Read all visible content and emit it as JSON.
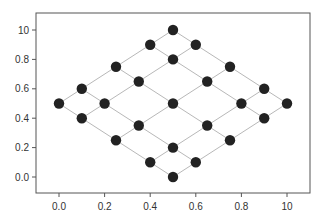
{
  "chart_data": {
    "type": "scatter",
    "title": "",
    "xlabel": "",
    "ylabel": "",
    "xlim": [
      -0.1,
      1.1
    ],
    "ylim": [
      -0.1,
      1.1
    ],
    "grid": false,
    "legend": null,
    "x_ticks": [
      {
        "value": 0.0,
        "label": "0.0"
      },
      {
        "value": 0.2,
        "label": "0.2"
      },
      {
        "value": 0.4,
        "label": "0.4"
      },
      {
        "value": 0.6,
        "label": "0.6"
      },
      {
        "value": 0.8,
        "label": "0.8"
      },
      {
        "value": 1.0,
        "label": "10"
      }
    ],
    "y_ticks": [
      {
        "value": 0.0,
        "label": "0.0"
      },
      {
        "value": 0.2,
        "label": "0.2"
      },
      {
        "value": 0.4,
        "label": "0.4"
      },
      {
        "value": 0.6,
        "label": "0.6"
      },
      {
        "value": 0.8,
        "label": "0.8"
      },
      {
        "value": 1.0,
        "label": "10"
      }
    ],
    "points": [
      [
        0.0,
        0.5
      ],
      [
        0.1,
        0.6
      ],
      [
        0.1,
        0.4
      ],
      [
        0.2,
        0.5
      ],
      [
        0.25,
        0.75
      ],
      [
        0.25,
        0.25
      ],
      [
        0.35,
        0.65
      ],
      [
        0.35,
        0.35
      ],
      [
        0.4,
        0.9
      ],
      [
        0.4,
        0.1
      ],
      [
        0.5,
        1.0
      ],
      [
        0.5,
        0.8
      ],
      [
        0.5,
        0.5
      ],
      [
        0.5,
        0.2
      ],
      [
        0.5,
        0.0
      ],
      [
        0.6,
        0.9
      ],
      [
        0.6,
        0.1
      ],
      [
        0.65,
        0.65
      ],
      [
        0.65,
        0.35
      ],
      [
        0.75,
        0.75
      ],
      [
        0.75,
        0.25
      ],
      [
        0.8,
        0.5
      ],
      [
        0.9,
        0.6
      ],
      [
        0.9,
        0.4
      ],
      [
        1.0,
        0.5
      ]
    ],
    "lines": [
      [
        [
          0.0,
          0.5
        ],
        [
          0.5,
          1.0
        ]
      ],
      [
        [
          0.1,
          0.4
        ],
        [
          0.6,
          0.9
        ]
      ],
      [
        [
          0.25,
          0.25
        ],
        [
          0.75,
          0.75
        ]
      ],
      [
        [
          0.4,
          0.1
        ],
        [
          0.9,
          0.6
        ]
      ],
      [
        [
          0.5,
          0.0
        ],
        [
          1.0,
          0.5
        ]
      ],
      [
        [
          0.0,
          0.5
        ],
        [
          0.5,
          0.0
        ]
      ],
      [
        [
          0.1,
          0.6
        ],
        [
          0.6,
          0.1
        ]
      ],
      [
        [
          0.25,
          0.75
        ],
        [
          0.75,
          0.25
        ]
      ],
      [
        [
          0.4,
          0.9
        ],
        [
          0.9,
          0.4
        ]
      ],
      [
        [
          0.5,
          1.0
        ],
        [
          1.0,
          0.5
        ]
      ]
    ],
    "colors": {
      "marker": "#222222",
      "line": "#b8b8b8",
      "frame": "#555555",
      "text": "#333333"
    }
  }
}
